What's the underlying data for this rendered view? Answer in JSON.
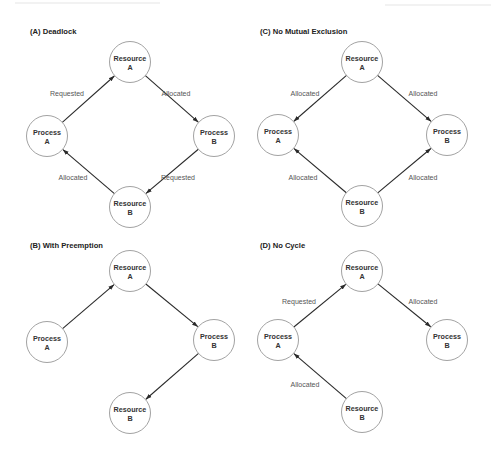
{
  "figure": {
    "colors": {
      "background": "#ffffff",
      "node_stroke": "#8a8a8a",
      "edge": "#2a2a2a",
      "title_text": "#222222",
      "node_text": "#333333",
      "edge_text": "#555555"
    },
    "node_radius": 20.5,
    "panels": [
      {
        "id": "A",
        "title": "(A) Deadlock",
        "title_pos": [
          30,
          34
        ],
        "nodes": [
          {
            "id": "resA",
            "line1": "Resource",
            "line2": "A",
            "cx": 130,
            "cy": 62
          },
          {
            "id": "procA",
            "line1": "Process",
            "line2": "A",
            "cx": 47,
            "cy": 136
          },
          {
            "id": "procB",
            "line1": "Process",
            "line2": "B",
            "cx": 214,
            "cy": 136
          },
          {
            "id": "resB",
            "line1": "Resource",
            "line2": "B",
            "cx": 130,
            "cy": 207
          }
        ],
        "edges": [
          {
            "from": "procA",
            "to": "resA",
            "label": "Requested",
            "lx": 67,
            "ly": 96
          },
          {
            "from": "resA",
            "to": "procB",
            "label": "Allocated",
            "lx": 176,
            "ly": 96
          },
          {
            "from": "procB",
            "to": "resB",
            "label": "Requested",
            "lx": 178,
            "ly": 180
          },
          {
            "from": "resB",
            "to": "procA",
            "label": "Allocated",
            "lx": 73,
            "ly": 180
          }
        ]
      },
      {
        "id": "C",
        "title": "(C) No Mutual Exclusion",
        "title_pos": [
          260,
          34
        ],
        "nodes": [
          {
            "id": "resA",
            "line1": "Resource",
            "line2": "A",
            "cx": 362,
            "cy": 62
          },
          {
            "id": "procA",
            "line1": "Process",
            "line2": "A",
            "cx": 278,
            "cy": 135
          },
          {
            "id": "procB",
            "line1": "Process",
            "line2": "B",
            "cx": 447,
            "cy": 135
          },
          {
            "id": "resB",
            "line1": "Resource",
            "line2": "B",
            "cx": 362,
            "cy": 206
          }
        ],
        "edges": [
          {
            "from": "resA",
            "to": "procA",
            "label": "Allocated",
            "lx": 305,
            "ly": 96
          },
          {
            "from": "resA",
            "to": "procB",
            "label": "Allocated",
            "lx": 423,
            "ly": 96
          },
          {
            "from": "resB",
            "to": "procA",
            "label": "Allocated",
            "lx": 303,
            "ly": 180
          },
          {
            "from": "resB",
            "to": "procB",
            "label": "Allocated",
            "lx": 423,
            "ly": 180
          }
        ]
      },
      {
        "id": "B",
        "title": "(B) With Preemption",
        "title_pos": [
          30,
          248
        ],
        "nodes": [
          {
            "id": "resA",
            "line1": "Resource",
            "line2": "A",
            "cx": 130,
            "cy": 271
          },
          {
            "id": "procA",
            "line1": "Process",
            "line2": "A",
            "cx": 47,
            "cy": 342
          },
          {
            "id": "procB",
            "line1": "Process",
            "line2": "B",
            "cx": 214,
            "cy": 340
          },
          {
            "id": "resB",
            "line1": "Resource",
            "line2": "B",
            "cx": 130,
            "cy": 413
          }
        ],
        "edges": [
          {
            "from": "procA",
            "to": "resA",
            "label": "",
            "lx": 0,
            "ly": 0
          },
          {
            "from": "resA",
            "to": "procB",
            "label": "",
            "lx": 0,
            "ly": 0
          },
          {
            "from": "procB",
            "to": "resB",
            "label": "",
            "lx": 0,
            "ly": 0
          }
        ]
      },
      {
        "id": "D",
        "title": "(D) No Cycle",
        "title_pos": [
          260,
          248
        ],
        "nodes": [
          {
            "id": "resA",
            "line1": "Resource",
            "line2": "A",
            "cx": 362,
            "cy": 271
          },
          {
            "id": "procA",
            "line1": "Process",
            "line2": "A",
            "cx": 278,
            "cy": 340
          },
          {
            "id": "procB",
            "line1": "Process",
            "line2": "B",
            "cx": 447,
            "cy": 340
          },
          {
            "id": "resB",
            "line1": "Resource",
            "line2": "B",
            "cx": 362,
            "cy": 412
          }
        ],
        "edges": [
          {
            "from": "procA",
            "to": "resA",
            "label": "Requested",
            "lx": 299,
            "ly": 304
          },
          {
            "from": "resA",
            "to": "procB",
            "label": "Allocated",
            "lx": 423,
            "ly": 304
          },
          {
            "from": "resB",
            "to": "procA",
            "label": "Allocated",
            "lx": 305,
            "ly": 387
          }
        ]
      }
    ]
  }
}
